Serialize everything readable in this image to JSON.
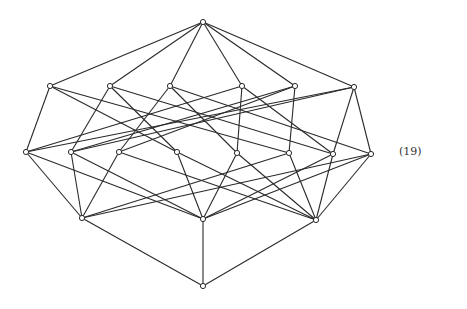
{
  "figure": {
    "equation_label": "(19)",
    "stroke_color": "#2a2a2a",
    "background": "#ffffff",
    "node_radius": 2.6
  },
  "nodes": [
    {
      "id": "T",
      "x": 203,
      "y": 22
    },
    {
      "id": "A1",
      "x": 50,
      "y": 86
    },
    {
      "id": "A2",
      "x": 110,
      "y": 86
    },
    {
      "id": "A3",
      "x": 170,
      "y": 86
    },
    {
      "id": "A4",
      "x": 242,
      "y": 86
    },
    {
      "id": "A5",
      "x": 295,
      "y": 86
    },
    {
      "id": "A6",
      "x": 354,
      "y": 87
    },
    {
      "id": "R1",
      "x": 26,
      "y": 152
    },
    {
      "id": "R2",
      "x": 71,
      "y": 152
    },
    {
      "id": "R3",
      "x": 119,
      "y": 152
    },
    {
      "id": "R4",
      "x": 177,
      "y": 152
    },
    {
      "id": "R5",
      "x": 237,
      "y": 153
    },
    {
      "id": "R6",
      "x": 289,
      "y": 153
    },
    {
      "id": "R7",
      "x": 333,
      "y": 154
    },
    {
      "id": "R8",
      "x": 371,
      "y": 154
    },
    {
      "id": "L1",
      "x": 82,
      "y": 218
    },
    {
      "id": "L2",
      "x": 203,
      "y": 219
    },
    {
      "id": "L3",
      "x": 316,
      "y": 220
    },
    {
      "id": "B",
      "x": 203,
      "y": 286
    }
  ],
  "edges": [
    [
      "T",
      "A1"
    ],
    [
      "T",
      "A2"
    ],
    [
      "T",
      "A3"
    ],
    [
      "T",
      "A4"
    ],
    [
      "T",
      "A5"
    ],
    [
      "T",
      "A6"
    ],
    [
      "A1",
      "R1"
    ],
    [
      "A1",
      "R4"
    ],
    [
      "A1",
      "R6"
    ],
    [
      "A2",
      "R2"
    ],
    [
      "A2",
      "R4"
    ],
    [
      "A2",
      "R7"
    ],
    [
      "A3",
      "R3"
    ],
    [
      "A3",
      "R5"
    ],
    [
      "A3",
      "R8"
    ],
    [
      "A4",
      "R5"
    ],
    [
      "A4",
      "R1"
    ],
    [
      "A4",
      "R7"
    ],
    [
      "A5",
      "R6"
    ],
    [
      "A5",
      "R3"
    ],
    [
      "A5",
      "R2"
    ],
    [
      "A6",
      "R7"
    ],
    [
      "A6",
      "R8"
    ],
    [
      "A6",
      "R1"
    ],
    [
      "A6",
      "R2"
    ],
    [
      "R1",
      "L1"
    ],
    [
      "R2",
      "L1"
    ],
    [
      "R3",
      "L1"
    ],
    [
      "R6",
      "L1"
    ],
    [
      "R8",
      "L1"
    ],
    [
      "R1",
      "L2"
    ],
    [
      "R2",
      "L2"
    ],
    [
      "R4",
      "L2"
    ],
    [
      "R5",
      "L2"
    ],
    [
      "R7",
      "L2"
    ],
    [
      "R8",
      "L2"
    ],
    [
      "R3",
      "L3"
    ],
    [
      "R4",
      "L3"
    ],
    [
      "R5",
      "L3"
    ],
    [
      "R6",
      "L3"
    ],
    [
      "R7",
      "L3"
    ],
    [
      "R8",
      "L3"
    ],
    [
      "L1",
      "B"
    ],
    [
      "L2",
      "B"
    ],
    [
      "L3",
      "B"
    ]
  ]
}
